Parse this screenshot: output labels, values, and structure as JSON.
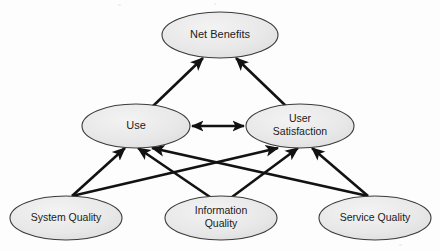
{
  "diagram": {
    "background_color": "#fdfdfd",
    "node_fill": "#e6e6e6",
    "node_fill_highlight": "#f2f2f2",
    "node_stroke": "#3a3a3a",
    "arrow_color": "#121212",
    "text_color": "#1b1b1b",
    "nodes": [
      {
        "id": "net-benefits",
        "label": "Net Benefits",
        "lines": [
          "Net Benefits"
        ],
        "cx": 220,
        "cy": 35,
        "rx": 58,
        "ry": 23,
        "font_size": 11
      },
      {
        "id": "use",
        "label": "Use",
        "lines": [
          "Use"
        ],
        "cx": 136,
        "cy": 126,
        "rx": 54,
        "ry": 22,
        "font_size": 11
      },
      {
        "id": "user-satisfaction",
        "label": "User Satisfaction",
        "lines": [
          "User",
          "Satisfaction"
        ],
        "cx": 300,
        "cy": 126,
        "rx": 54,
        "ry": 22,
        "font_size": 10.5
      },
      {
        "id": "system-quality",
        "label": "System Quality",
        "lines": [
          "System Quality"
        ],
        "cx": 66,
        "cy": 218,
        "rx": 56,
        "ry": 22,
        "font_size": 10.5
      },
      {
        "id": "information-quality",
        "label": "Information Quality",
        "lines": [
          "Information",
          "Quality"
        ],
        "cx": 221,
        "cy": 218,
        "rx": 56,
        "ry": 22,
        "font_size": 10.5
      },
      {
        "id": "service-quality",
        "label": "Service Quality",
        "lines": [
          "Service Quality"
        ],
        "cx": 375,
        "cy": 218,
        "rx": 56,
        "ry": 22,
        "font_size": 10.5
      }
    ],
    "edges": [
      {
        "id": "use-to-net-benefits",
        "from": "use",
        "to": "net-benefits",
        "type": "single",
        "x1": 152,
        "y1": 107,
        "x2": 203,
        "y2": 58
      },
      {
        "id": "satisfaction-to-net-benefits",
        "from": "user-satisfaction",
        "to": "net-benefits",
        "type": "single",
        "x1": 287,
        "y1": 107,
        "x2": 236,
        "y2": 58
      },
      {
        "id": "use-satisfaction-mutual",
        "from": "use",
        "to": "user-satisfaction",
        "type": "double",
        "x1": 192,
        "y1": 126,
        "x2": 244,
        "y2": 126
      },
      {
        "id": "system-quality-to-use",
        "from": "system-quality",
        "to": "use",
        "type": "single",
        "x1": 72,
        "y1": 196,
        "x2": 125,
        "y2": 148
      },
      {
        "id": "system-quality-to-satisfaction",
        "from": "system-quality",
        "to": "user-satisfaction",
        "type": "single",
        "x1": 72,
        "y1": 196,
        "x2": 278,
        "y2": 148
      },
      {
        "id": "information-quality-to-use",
        "from": "information-quality",
        "to": "use",
        "type": "single",
        "x1": 210,
        "y1": 197,
        "x2": 138,
        "y2": 148
      },
      {
        "id": "information-quality-to-satisfaction",
        "from": "information-quality",
        "to": "user-satisfaction",
        "type": "single",
        "x1": 232,
        "y1": 197,
        "x2": 298,
        "y2": 148
      },
      {
        "id": "service-quality-to-use",
        "from": "service-quality",
        "to": "use",
        "type": "single",
        "x1": 368,
        "y1": 196,
        "x2": 152,
        "y2": 148
      },
      {
        "id": "service-quality-to-satisfaction",
        "from": "service-quality",
        "to": "user-satisfaction",
        "type": "single",
        "x1": 368,
        "y1": 196,
        "x2": 312,
        "y2": 148
      }
    ]
  }
}
